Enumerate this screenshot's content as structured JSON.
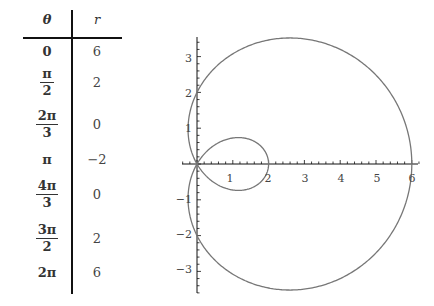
{
  "table": {
    "headers": {
      "theta": "θ",
      "r": "r"
    },
    "rows": [
      {
        "theta": "0",
        "theta_num": null,
        "theta_den": null,
        "r": "6"
      },
      {
        "theta": null,
        "theta_num": "π",
        "theta_den": "2",
        "r": "2"
      },
      {
        "theta": null,
        "theta_num": "2π",
        "theta_den": "3",
        "r": "0"
      },
      {
        "theta": "π",
        "theta_num": null,
        "theta_den": null,
        "r": "−2"
      },
      {
        "theta": null,
        "theta_num": "4π",
        "theta_den": "3",
        "r": "0"
      },
      {
        "theta": null,
        "theta_num": "3π",
        "theta_den": "2",
        "r": "2"
      },
      {
        "theta": "2π",
        "theta_num": null,
        "theta_den": null,
        "r": "6"
      }
    ]
  },
  "plot": {
    "x_ticks": [
      "1",
      "2",
      "3",
      "4",
      "5",
      "6"
    ],
    "y_ticks_pos": [
      "1",
      "2",
      "3"
    ],
    "y_ticks_neg": [
      "−1",
      "−2",
      "−3"
    ],
    "curve_color": "#777777",
    "axis_color": "#111111"
  },
  "chart_data": {
    "type": "line",
    "title": "",
    "equation": "r = 2 + 4cos(θ)",
    "table": {
      "columns": [
        "θ",
        "r"
      ],
      "rows": [
        [
          "0",
          6
        ],
        [
          "π/2",
          2
        ],
        [
          "2π/3",
          0
        ],
        [
          "π",
          -2
        ],
        [
          "4π/3",
          0
        ],
        [
          "3π/2",
          2
        ],
        [
          "2π",
          6
        ]
      ]
    },
    "xlabel": "",
    "ylabel": "",
    "xlim": [
      -0.4,
      6.2
    ],
    "ylim": [
      -3.6,
      3.5
    ],
    "x_tick_labels": [
      1,
      2,
      3,
      4,
      5,
      6
    ],
    "y_tick_labels": [
      -3,
      -2,
      -1,
      1,
      2,
      3
    ],
    "minor_ticks": 0.2,
    "key_points": [
      [
        6,
        0
      ],
      [
        0,
        2
      ],
      [
        0,
        0
      ],
      [
        2,
        0
      ],
      [
        0,
        -2
      ]
    ],
    "grid": false,
    "legend": null
  }
}
